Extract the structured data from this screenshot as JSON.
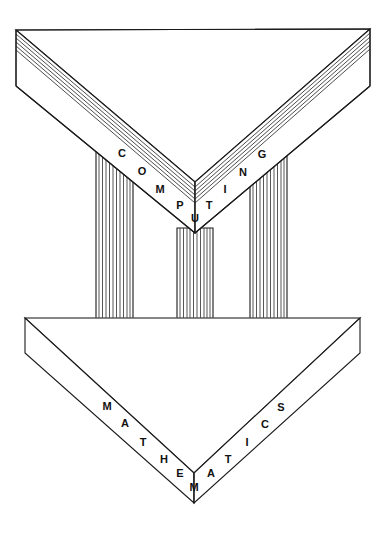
{
  "figure": {
    "background_color": "#ffffff",
    "line_color": "#1a1a1a",
    "text_color": "#111111"
  },
  "pediment": {
    "name": "COMPUTING",
    "word": "COMPUTING",
    "letters": [
      {
        "char": "C",
        "x": 122,
        "y": 154
      },
      {
        "char": "O",
        "x": 142,
        "y": 172
      },
      {
        "char": "M",
        "x": 160,
        "y": 190
      },
      {
        "char": "P",
        "x": 180,
        "y": 206
      },
      {
        "char": "U",
        "x": 195,
        "y": 219
      },
      {
        "char": "T",
        "x": 209,
        "y": 206
      },
      {
        "char": "I",
        "x": 225,
        "y": 190
      },
      {
        "char": "N",
        "x": 243,
        "y": 173
      },
      {
        "char": "G",
        "x": 262,
        "y": 155
      }
    ],
    "geometry": {
      "top_left": [
        16,
        30
      ],
      "top_right": [
        370,
        29
      ],
      "apex_top": [
        195,
        182
      ],
      "front_left": [
        16,
        86
      ],
      "front_right": [
        370,
        86
      ],
      "apex_front": [
        195,
        233
      ],
      "layer_count": 5
    }
  },
  "base": {
    "name": "MATHEMATICS",
    "word": "MATHEMATICS",
    "letters": [
      {
        "char": "M",
        "x": 107,
        "y": 407
      },
      {
        "char": "A",
        "x": 125,
        "y": 424
      },
      {
        "char": "T",
        "x": 143,
        "y": 443
      },
      {
        "char": "H",
        "x": 164,
        "y": 460
      },
      {
        "char": "E",
        "x": 180,
        "y": 474
      },
      {
        "char": "M",
        "x": 194,
        "y": 488
      },
      {
        "char": "A",
        "x": 211,
        "y": 474
      },
      {
        "char": "T",
        "x": 228,
        "y": 460
      },
      {
        "char": "I",
        "x": 247,
        "y": 443
      },
      {
        "char": "C",
        "x": 265,
        "y": 425
      },
      {
        "char": "S",
        "x": 281,
        "y": 408
      }
    ],
    "geometry": {
      "top_left": [
        25,
        318
      ],
      "top_right": [
        360,
        318
      ],
      "apex_top": [
        194,
        473
      ],
      "front_left": [
        25,
        353
      ],
      "front_right": [
        360,
        353
      ],
      "apex_front": [
        194,
        503
      ]
    }
  },
  "columns": [
    {
      "id": "left-column",
      "x_left": 96,
      "x_right": 133,
      "top": 152,
      "bottom": 370,
      "flutes": 13
    },
    {
      "id": "center-column",
      "x_left": 177,
      "x_right": 213,
      "top": 228,
      "bottom": 413,
      "flutes": 13
    },
    {
      "id": "right-column",
      "x_left": 250,
      "x_right": 287,
      "top": 152,
      "bottom": 370,
      "flutes": 13
    }
  ]
}
